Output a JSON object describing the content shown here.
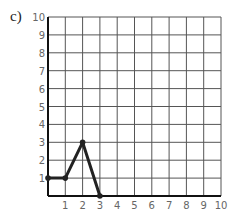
{
  "panel_label": "c)",
  "chart_data": {
    "type": "line",
    "title": "",
    "xlabel": "",
    "ylabel": "",
    "xlim": [
      0,
      10
    ],
    "ylim": [
      0,
      10
    ],
    "grid": true,
    "x_ticks": [
      "1",
      "2",
      "3",
      "4",
      "5",
      "6",
      "7",
      "8",
      "9",
      "10"
    ],
    "y_ticks": [
      "1",
      "2",
      "3",
      "4",
      "5",
      "6",
      "7",
      "8",
      "9",
      "10"
    ],
    "series": [
      {
        "name": "line",
        "x": [
          0,
          1,
          2,
          3
        ],
        "y": [
          1,
          1,
          3,
          0
        ],
        "color": "#222222"
      }
    ]
  }
}
